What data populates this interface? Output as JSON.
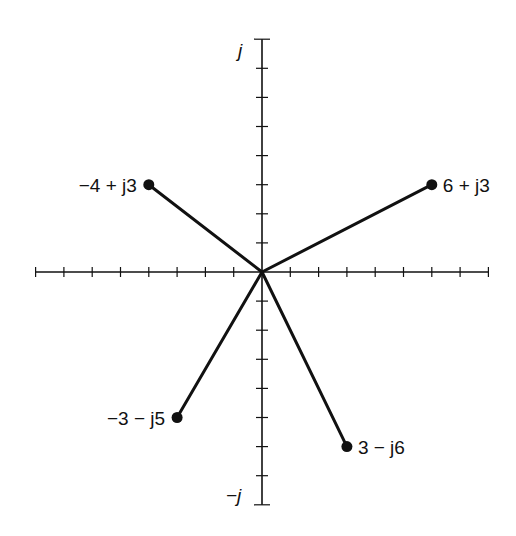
{
  "diagram": {
    "type": "complex-plane-phasor",
    "origin_px": [
      262,
      272
    ],
    "unit_px": [
      28.3,
      29.1
    ],
    "axes": {
      "real": {
        "min": -8,
        "max": 8,
        "ticks": [
          -8,
          -7,
          -6,
          -5,
          -4,
          -3,
          -2,
          -1,
          1,
          2,
          3,
          4,
          5,
          6,
          7,
          8
        ]
      },
      "imag": {
        "min": -8,
        "max": 8,
        "ticks": [
          -8,
          -7,
          -6,
          -5,
          -4,
          -3,
          -2,
          -1,
          1,
          2,
          3,
          4,
          5,
          6,
          7,
          8
        ],
        "top_label": "j",
        "bottom_label": "−j"
      }
    },
    "colors": {
      "line": "#111111",
      "background": "#ffffff"
    },
    "phasors": [
      {
        "re": -4,
        "im": 3,
        "label": "−4 + j3",
        "label_side": "left"
      },
      {
        "re": 6,
        "im": 3,
        "label": "6 + j3",
        "label_side": "right"
      },
      {
        "re": -3,
        "im": -5,
        "label": "−3 − j5",
        "label_side": "left"
      },
      {
        "re": 3,
        "im": -6,
        "label": "3 − j6",
        "label_side": "right"
      }
    ]
  }
}
